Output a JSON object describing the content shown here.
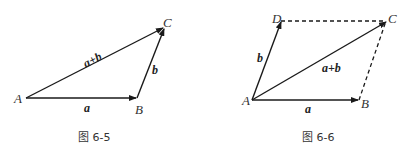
{
  "figures": [
    {
      "caption": "图 6-5",
      "points": {
        "A": "A",
        "B": "B",
        "C": "C"
      },
      "vectors": {
        "a": "a",
        "b": "b",
        "sum": "a+b"
      }
    },
    {
      "caption": "图 6-6",
      "points": {
        "A": "A",
        "B": "B",
        "C": "C",
        "D": "D"
      },
      "vectors": {
        "a": "a",
        "b": "b",
        "sum": "a+b"
      }
    }
  ],
  "colors": {
    "line": "#1a1a1a",
    "text": "#333333"
  }
}
